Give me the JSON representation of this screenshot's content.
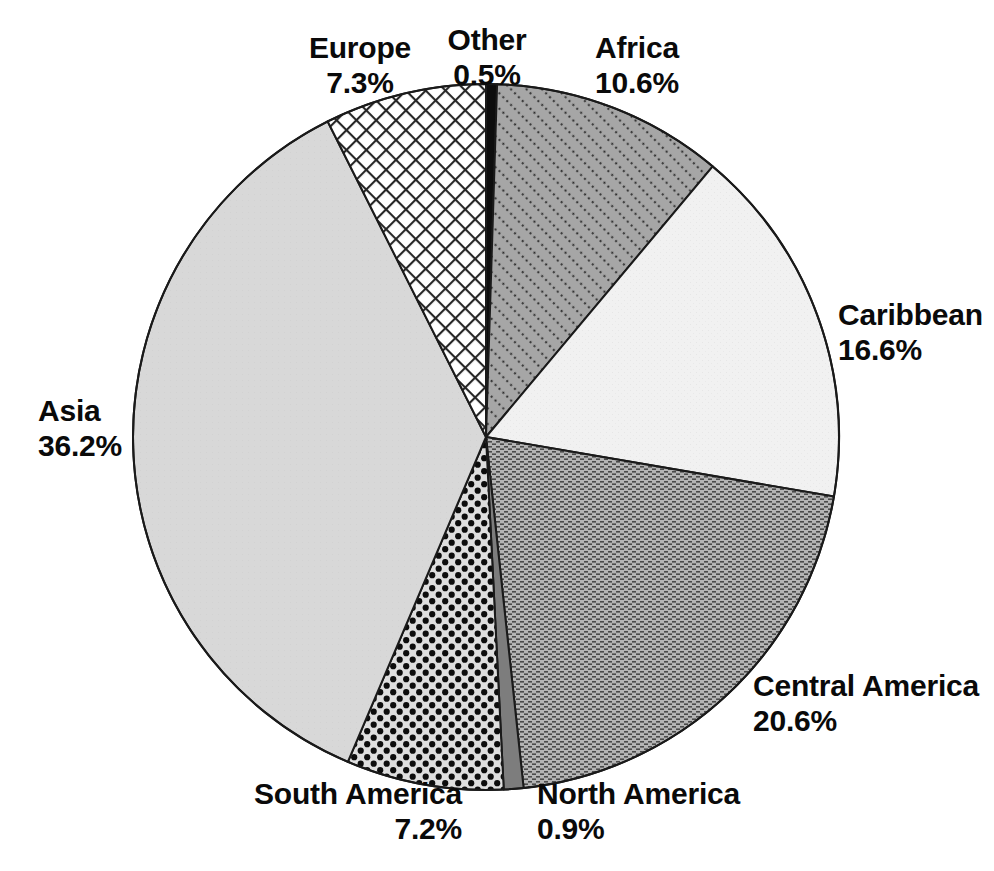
{
  "chart_data": {
    "type": "pie",
    "title": "",
    "subtitle": "",
    "xlabel": "",
    "ylabel": "",
    "legend_position": "none",
    "grid": false,
    "start_angle_deg": 0,
    "direction": "clockwise",
    "units": "percent",
    "total": 99.9,
    "categories": [
      "Other",
      "Africa",
      "Caribbean",
      "Central America",
      "North America",
      "South America",
      "Asia",
      "Europe"
    ],
    "values": [
      0.5,
      10.6,
      16.6,
      20.6,
      0.9,
      7.2,
      36.2,
      7.3
    ],
    "slices": [
      {
        "id": "other",
        "label": "Other",
        "value": 0.5,
        "value_text": "0.5%",
        "fill_style": "solid-black",
        "fill_color": "#0d0d0d",
        "start_deg": 0.0,
        "end_deg": 1.8
      },
      {
        "id": "africa",
        "label": "Africa",
        "value": 10.6,
        "value_text": "10.6%",
        "fill_style": "dotted-diagonal-hatch",
        "fill_color": "#a6a6a6",
        "start_deg": 1.8,
        "end_deg": 39.96
      },
      {
        "id": "caribbean",
        "label": "Caribbean",
        "value": 16.6,
        "value_text": "16.6%",
        "fill_style": "very-light-solid",
        "fill_color": "#f0f0f0",
        "start_deg": 39.96,
        "end_deg": 99.72
      },
      {
        "id": "central-america",
        "label": "Central America",
        "value": 20.6,
        "value_text": "20.6%",
        "fill_style": "horizontal-dash-hatch",
        "fill_color": "#b2b2b2",
        "start_deg": 99.72,
        "end_deg": 173.88
      },
      {
        "id": "north-america",
        "label": "North America",
        "value": 0.9,
        "value_text": "0.9%",
        "fill_style": "medium-gray-solid",
        "fill_color": "#7d7d7d",
        "start_deg": 173.88,
        "end_deg": 177.12
      },
      {
        "id": "south-america",
        "label": "South America",
        "value": 7.2,
        "value_text": "7.2%",
        "fill_style": "large-black-dots",
        "fill_color": "#dcdcdc",
        "start_deg": 177.12,
        "end_deg": 203.04
      },
      {
        "id": "asia",
        "label": "Asia",
        "value": 36.2,
        "value_text": "36.2%",
        "fill_style": "light-gray-solid",
        "fill_color": "#d7d7d7",
        "start_deg": 203.04,
        "end_deg": 333.36
      },
      {
        "id": "europe",
        "label": "Europe",
        "value": 7.3,
        "value_text": "7.3%",
        "fill_style": "diagonal-crosshatch",
        "fill_color": "#ffffff",
        "start_deg": 333.36,
        "end_deg": 360.0
      }
    ],
    "geometry": {
      "center_x": 486,
      "center_y": 437,
      "radius": 353,
      "outline_color": "#1a1a1a",
      "outline_width": 2
    }
  },
  "labels": {
    "europe": {
      "name": "Europe",
      "pct": "7.3%"
    },
    "other": {
      "name": "Other",
      "pct": "0.5%"
    },
    "africa": {
      "name": "Africa",
      "pct": "10.6%"
    },
    "caribbean": {
      "name": "Caribbean",
      "pct": "16.6%"
    },
    "asia": {
      "name": "Asia",
      "pct": "36.2%"
    },
    "central_america": {
      "name": "Central America",
      "pct": "20.6%"
    },
    "south_america": {
      "name": "South America",
      "pct": "7.2%"
    },
    "north_america": {
      "name": "North America",
      "pct": "0.9%"
    }
  }
}
